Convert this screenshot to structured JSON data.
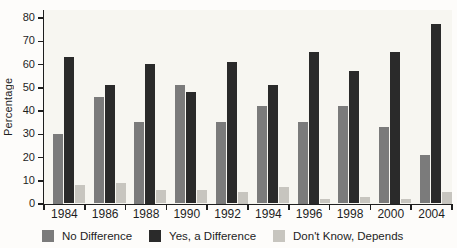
{
  "figure": {
    "ylabel": "Percentage"
  },
  "chart_data": {
    "type": "bar",
    "title": "",
    "xlabel": "",
    "ylabel": "Percentage",
    "ylim": [
      0,
      80
    ],
    "yticks": [
      0,
      10,
      20,
      30,
      40,
      50,
      60,
      70,
      80
    ],
    "grid": false,
    "legend_position": "bottom",
    "categories": [
      "1984",
      "1986",
      "1988",
      "1990",
      "1992",
      "1994",
      "1996",
      "1998",
      "2000",
      "2004"
    ],
    "series": [
      {
        "name": "No Difference",
        "color": "#7b7b7b",
        "values": [
          30,
          46,
          35,
          51,
          35,
          42,
          35,
          42,
          33,
          21
        ]
      },
      {
        "name": "Yes, a Difference",
        "color": "#2a2a2a",
        "values": [
          63,
          51,
          60,
          48,
          61,
          51,
          65,
          57,
          65,
          77
        ]
      },
      {
        "name": "Don't Know, Depends",
        "color": "#c7c5bf",
        "values": [
          8,
          9,
          6,
          6,
          5,
          7,
          2,
          3,
          2,
          5
        ]
      }
    ],
    "colors": {
      "axis": "#1e1e1e",
      "text": "#1e1e1e",
      "plot_background": "#f7f6f1",
      "page_background": "#fdfcfa"
    }
  }
}
